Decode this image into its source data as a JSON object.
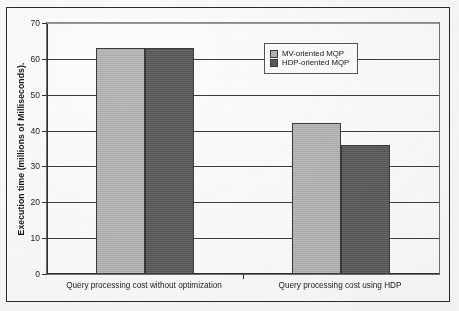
{
  "chart_data": {
    "type": "bar",
    "title": "",
    "xlabel": "",
    "ylabel": "Execution time (millions of Milliseconds).",
    "ylim": [
      0,
      70
    ],
    "ytick_labels": [
      "0",
      "10",
      "20",
      "30",
      "40",
      "50",
      "60",
      "70"
    ],
    "yticks": [
      0,
      10,
      20,
      30,
      40,
      50,
      60,
      70
    ],
    "grid": true,
    "legend_position": "upper-right-inside",
    "categories": [
      "Query processing cost without optimization",
      "Query processing cost using HDP"
    ],
    "series": [
      {
        "name": "MV-oriented MQP",
        "color": "#b2b2b2",
        "values": [
          63,
          42
        ]
      },
      {
        "name": "HDP-oriented MQP",
        "color": "#595959",
        "values": [
          63,
          36
        ]
      }
    ]
  },
  "legend": {
    "items": [
      {
        "label": "MV-oriented MQP"
      },
      {
        "label": "HDP-oriented MQP"
      }
    ]
  }
}
